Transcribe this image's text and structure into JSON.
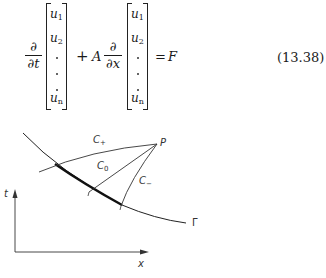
{
  "equation": {
    "term1_numerator": "∂",
    "term1_denominator": "∂t",
    "plus": "+",
    "coefficient": "A",
    "term2_numerator": "∂",
    "term2_denominator": "∂x",
    "equals": "=",
    "rhs": "F",
    "number": "(13.38)",
    "vector_entries": [
      {
        "var": "u",
        "sub": "1"
      },
      {
        "var": "u",
        "sub": "2"
      },
      {
        "var": "u",
        "sub": "n"
      }
    ]
  },
  "figure": {
    "labels": {
      "c_plus": "C",
      "c_plus_sub": "+",
      "c_zero": "C",
      "c_zero_sub": "0",
      "c_minus": "C",
      "c_minus_sub": "−",
      "point": "P",
      "curve": "Γ",
      "t_axis": "t",
      "x_axis": "x"
    }
  }
}
